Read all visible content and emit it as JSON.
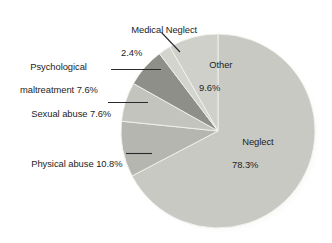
{
  "chart_data": {
    "type": "pie",
    "title": "",
    "subtitle": "",
    "xlabel": "",
    "ylabel": "",
    "legend_position": "none",
    "grid": false,
    "units": "percent",
    "start_angle_deg": 0,
    "direction": "clockwise",
    "categories": [
      "Neglect",
      "Physical abuse",
      "Sexual abuse",
      "Psychological maltreatment",
      "Medical Neglect",
      "Other"
    ],
    "values": [
      78.3,
      10.8,
      7.6,
      7.6,
      2.4,
      9.6
    ],
    "slices": [
      {
        "name": "Neglect",
        "label": "Neglect",
        "value": 78.3,
        "value_label": "78.3%",
        "color": "#c9c9c4",
        "label_placement": "inside"
      },
      {
        "name": "Physical abuse",
        "label": "Physical abuse",
        "value": 10.8,
        "value_label": "10.8%",
        "color": "#b6b6b1",
        "label_placement": "outside-left"
      },
      {
        "name": "Sexual abuse",
        "label": "Sexual abuse",
        "value": 7.6,
        "value_label": "7.6%",
        "color": "#c4c4bf",
        "label_placement": "outside-left"
      },
      {
        "name": "Psychological maltreatment",
        "label": "Psychological maltreatment",
        "value": 7.6,
        "value_label": "7.6%",
        "color": "#8f8f8a",
        "label_placement": "outside-left"
      },
      {
        "name": "Medical Neglect",
        "label": "Medical Neglect",
        "value": 2.4,
        "value_label": "2.4%",
        "color": "#d4d4cf",
        "label_placement": "outside-top"
      },
      {
        "name": "Other",
        "label": "Other",
        "value": 9.6,
        "value_label": "9.6%",
        "color": "#d0d0cb",
        "label_placement": "inside"
      }
    ]
  },
  "labels": {
    "medical_neglect": {
      "name": "Medical Neglect",
      "pct": "2.4%"
    },
    "psychological": {
      "line1": "Psychological",
      "line2": "maltreatment 7.6%"
    },
    "sexual_abuse": {
      "text": "Sexual abuse 7.6%"
    },
    "physical_abuse": {
      "text": "Physical abuse 10.8%"
    },
    "other": {
      "name": "Other",
      "pct": "9.6%"
    },
    "neglect": {
      "name": "Neglect",
      "pct": "78.3%"
    }
  },
  "colors": {
    "background": "#ffffff",
    "text": "#1d1d1d",
    "leader_line": "#2a2a2a",
    "slice_neglect": "#c9c9c4",
    "slice_physical": "#b6b6b1",
    "slice_sexual": "#c4c4bf",
    "slice_psychological": "#8f8f8a",
    "slice_medical": "#d4d4cf",
    "slice_other": "#d0d0cb",
    "slice_edge": "#f2f2ee",
    "shadow": "#e8e8e4"
  }
}
